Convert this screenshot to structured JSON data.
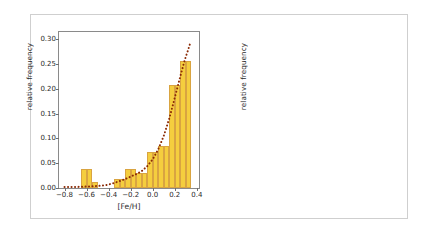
{
  "figure": {
    "background": "#ffffff",
    "bar_color": "#F5CE3E",
    "bar_edge_color": "#D9A441",
    "curve_color": "#8B2B06",
    "frame_color": "#cfcfcf"
  },
  "chart_data": [
    {
      "type": "bar",
      "panel": "left",
      "title": "",
      "xlabel": "[Fe/H]",
      "ylabel": "relative frequency",
      "xlim": [
        -0.85,
        0.42
      ],
      "ylim": [
        0.0,
        0.315
      ],
      "xticks": [
        -0.8,
        -0.6,
        -0.4,
        -0.2,
        0.0,
        0.2,
        0.4
      ],
      "xticklabels": [
        "-0.8",
        "-0.6",
        "-0.4",
        "-0.2",
        "0.0",
        "0.2",
        "0.4"
      ],
      "yticks": [
        0.0,
        0.05,
        0.1,
        0.15,
        0.2,
        0.25,
        0.3
      ],
      "yticklabels": [
        "0.00",
        "0.05",
        "0.10",
        "0.15",
        "0.20",
        "0.25",
        "0.30"
      ],
      "grid": false,
      "legend": "none",
      "bin_width": 0.05,
      "bins": [
        {
          "left": -0.8,
          "right": -0.75,
          "value": 0.0
        },
        {
          "left": -0.75,
          "right": -0.7,
          "value": 0.0
        },
        {
          "left": -0.7,
          "right": -0.65,
          "value": 0.0
        },
        {
          "left": -0.65,
          "right": -0.6,
          "value": 0.039
        },
        {
          "left": -0.6,
          "right": -0.55,
          "value": 0.039
        },
        {
          "left": -0.55,
          "right": -0.5,
          "value": 0.013
        },
        {
          "left": -0.5,
          "right": -0.45,
          "value": 0.0
        },
        {
          "left": -0.45,
          "right": -0.4,
          "value": 0.0
        },
        {
          "left": -0.4,
          "right": -0.35,
          "value": 0.0
        },
        {
          "left": -0.35,
          "right": -0.3,
          "value": 0.019
        },
        {
          "left": -0.3,
          "right": -0.25,
          "value": 0.019
        },
        {
          "left": -0.25,
          "right": -0.2,
          "value": 0.039
        },
        {
          "left": -0.2,
          "right": -0.15,
          "value": 0.039
        },
        {
          "left": -0.15,
          "right": -0.1,
          "value": 0.031
        },
        {
          "left": -0.1,
          "right": -0.05,
          "value": 0.031
        },
        {
          "left": -0.05,
          "right": 0.0,
          "value": 0.073
        },
        {
          "left": 0.0,
          "right": 0.05,
          "value": 0.073
        },
        {
          "left": 0.05,
          "right": 0.1,
          "value": 0.085
        },
        {
          "left": 0.1,
          "right": 0.15,
          "value": 0.085
        },
        {
          "left": 0.15,
          "right": 0.2,
          "value": 0.208
        },
        {
          "left": 0.2,
          "right": 0.25,
          "value": 0.208
        },
        {
          "left": 0.25,
          "right": 0.3,
          "value": 0.257
        },
        {
          "left": 0.3,
          "right": 0.35,
          "value": 0.257
        }
      ],
      "fit_curve": {
        "style": "dotted",
        "color": "#8B2B06",
        "points": [
          {
            "x": -0.8,
            "y": 0.002
          },
          {
            "x": -0.7,
            "y": 0.002
          },
          {
            "x": -0.6,
            "y": 0.003
          },
          {
            "x": -0.5,
            "y": 0.004
          },
          {
            "x": -0.42,
            "y": 0.006
          },
          {
            "x": -0.35,
            "y": 0.01
          },
          {
            "x": -0.3,
            "y": 0.014
          },
          {
            "x": -0.25,
            "y": 0.018
          },
          {
            "x": -0.2,
            "y": 0.023
          },
          {
            "x": -0.15,
            "y": 0.028
          },
          {
            "x": -0.1,
            "y": 0.034
          },
          {
            "x": -0.05,
            "y": 0.044
          },
          {
            "x": 0.0,
            "y": 0.058
          },
          {
            "x": 0.05,
            "y": 0.078
          },
          {
            "x": 0.1,
            "y": 0.105
          },
          {
            "x": 0.15,
            "y": 0.14
          },
          {
            "x": 0.2,
            "y": 0.182
          },
          {
            "x": 0.25,
            "y": 0.225
          },
          {
            "x": 0.29,
            "y": 0.258
          },
          {
            "x": 0.32,
            "y": 0.278
          },
          {
            "x": 0.34,
            "y": 0.292
          }
        ]
      }
    },
    {
      "type": "bar",
      "panel": "right",
      "title": "",
      "xlabel": "[Fe/H]",
      "ylabel": "relative frequency",
      "xlim": [
        -0.85,
        0.46
      ],
      "ylim": [
        0.0,
        0.0215
      ],
      "xticks": [
        -0.8,
        -0.6,
        -0.4,
        -0.2,
        0.0,
        0.2,
        0.4
      ],
      "xticklabels": [
        "-0.8",
        "-0.6",
        "-0.4",
        "-0.2",
        "0.0",
        "0.2",
        "0.4"
      ],
      "yticks": [
        0.0,
        0.005,
        0.01,
        0.015,
        0.02
      ],
      "yticklabels": [
        "0.000",
        "0.005",
        "0.010",
        "0.015",
        "0.020"
      ],
      "grid": false,
      "legend": "none",
      "bin_width": 0.1,
      "bins": [
        {
          "left": -0.4,
          "right": -0.3,
          "value": 0.017
        },
        {
          "left": -0.3,
          "right": -0.2,
          "value": 0.0091
        },
        {
          "left": -0.2,
          "right": -0.1,
          "value": 0.0035
        },
        {
          "left": -0.1,
          "right": 0.0,
          "value": 0.0083
        },
        {
          "left": 0.1,
          "right": 0.2,
          "value": 0.0054
        },
        {
          "left": 0.2,
          "right": 0.3,
          "value": 0.0104
        }
      ]
    }
  ]
}
